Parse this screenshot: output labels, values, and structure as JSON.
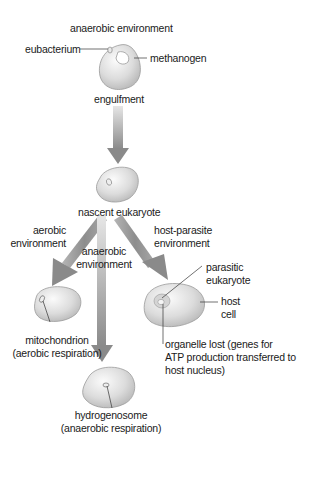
{
  "diagram": {
    "stage1": {
      "environment": "anaerobic environment",
      "left_label": "eubacterium",
      "right_label": "methanogen"
    },
    "transition1": "engulfment",
    "stage2": {
      "label": "nascent eukaryote"
    },
    "branches": [
      {
        "environment_line1": "aerobic",
        "environment_line2": "environment",
        "result_line1": "mitochondrion",
        "result_line2": "(aerobic respiration)"
      },
      {
        "environment_line1": "anaerobic",
        "environment_line2": "environment",
        "result_line1": "hydrogenosome",
        "result_line2": "(anaerobic respiration)"
      },
      {
        "environment_line1": "host-parasite",
        "environment_line2": "environment",
        "parasite_line1": "parasitic",
        "parasite_line2": "eukaryote",
        "host_line1": "host",
        "host_line2": "cell",
        "result_line1": "organelle lost (genes for",
        "result_line2": "ATP production transferred to",
        "result_line3": "host nucleus)"
      }
    ],
    "colors": {
      "arrow": "#8a8a8a",
      "cell_fill": "#dedede",
      "cell_edge": "#9a9a9a",
      "text": "#1a1a1a"
    }
  }
}
